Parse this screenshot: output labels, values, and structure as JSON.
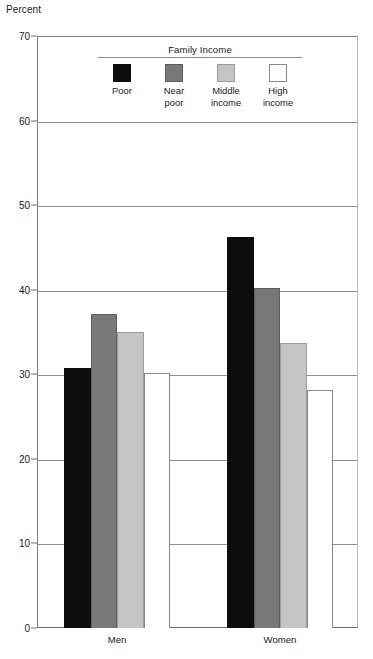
{
  "chart_data": {
    "type": "bar",
    "title": "",
    "xlabel": "",
    "ylabel": "Percent",
    "ylim": [
      0,
      70
    ],
    "yticks": [
      0,
      10,
      20,
      30,
      40,
      50,
      60,
      70
    ],
    "ytick_labels": [
      "0",
      "10",
      "20",
      "30",
      "40",
      "50",
      "60",
      "70"
    ],
    "grid": true,
    "legend_title": "Family Income",
    "legend_position": "inside-top-center",
    "categories": [
      "Men",
      "Women"
    ],
    "series": [
      {
        "name": "Poor",
        "label": "Poor",
        "color": "#0d0d0d",
        "border": "#0d0d0d",
        "values": [
          30.8,
          46.2
        ]
      },
      {
        "name": "Near poor",
        "label": "Near\npoor",
        "color": "#787878",
        "border": "#5e5e5e",
        "values": [
          37.1,
          40.2
        ]
      },
      {
        "name": "Middle income",
        "label": "Middle\nincome",
        "color": "#c5c5c5",
        "border": "#9b9b9b",
        "values": [
          35.0,
          33.7
        ]
      },
      {
        "name": "High income",
        "label": "High\nincome",
        "color": "#ffffff",
        "border": "#8a8a8a",
        "values": [
          30.2,
          28.1
        ]
      }
    ]
  },
  "figure": {
    "axis_unit": "Percent"
  }
}
